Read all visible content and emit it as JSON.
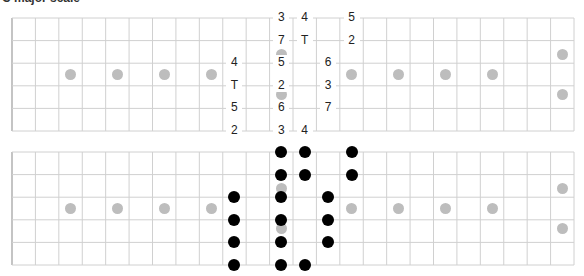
{
  "title": "C major scale",
  "colors": {
    "grid": "#d0d0d0",
    "nut": "#c4c4c4",
    "inlay": "#bdbdbd",
    "note": "#000000",
    "label": "#222222"
  },
  "fretboard": {
    "frets": 24,
    "strings": 6,
    "inlay_frets_single": [
      3,
      5,
      7,
      9,
      15,
      17,
      19,
      21
    ],
    "inlay_frets_double": [
      12,
      24
    ]
  },
  "top_board": {
    "labels": [
      {
        "string": 1,
        "fret": 12,
        "text": "3"
      },
      {
        "string": 1,
        "fret": 13,
        "text": "4"
      },
      {
        "string": 1,
        "fret": 15,
        "text": "5"
      },
      {
        "string": 2,
        "fret": 12,
        "text": "7"
      },
      {
        "string": 2,
        "fret": 13,
        "text": "T"
      },
      {
        "string": 2,
        "fret": 15,
        "text": "2"
      },
      {
        "string": 3,
        "fret": 10,
        "text": "4"
      },
      {
        "string": 3,
        "fret": 12,
        "text": "5"
      },
      {
        "string": 3,
        "fret": 14,
        "text": "6"
      },
      {
        "string": 4,
        "fret": 10,
        "text": "T"
      },
      {
        "string": 4,
        "fret": 12,
        "text": "2"
      },
      {
        "string": 4,
        "fret": 14,
        "text": "3"
      },
      {
        "string": 5,
        "fret": 10,
        "text": "5"
      },
      {
        "string": 5,
        "fret": 12,
        "text": "6"
      },
      {
        "string": 5,
        "fret": 14,
        "text": "7"
      },
      {
        "string": 6,
        "fret": 10,
        "text": "2"
      },
      {
        "string": 6,
        "fret": 12,
        "text": "3"
      },
      {
        "string": 6,
        "fret": 13,
        "text": "4"
      }
    ]
  },
  "bottom_board": {
    "notes": [
      {
        "string": 1,
        "fret": 12
      },
      {
        "string": 1,
        "fret": 13
      },
      {
        "string": 1,
        "fret": 15
      },
      {
        "string": 2,
        "fret": 12
      },
      {
        "string": 2,
        "fret": 13
      },
      {
        "string": 2,
        "fret": 15
      },
      {
        "string": 3,
        "fret": 10
      },
      {
        "string": 3,
        "fret": 12
      },
      {
        "string": 3,
        "fret": 14
      },
      {
        "string": 4,
        "fret": 10
      },
      {
        "string": 4,
        "fret": 12
      },
      {
        "string": 4,
        "fret": 14
      },
      {
        "string": 5,
        "fret": 10
      },
      {
        "string": 5,
        "fret": 12
      },
      {
        "string": 5,
        "fret": 14
      },
      {
        "string": 6,
        "fret": 10
      },
      {
        "string": 6,
        "fret": 12
      },
      {
        "string": 6,
        "fret": 13
      }
    ]
  }
}
